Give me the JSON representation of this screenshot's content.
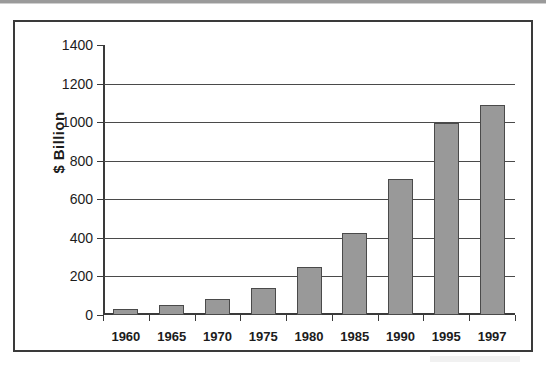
{
  "chart_data": {
    "type": "bar",
    "title": "",
    "subtitle": "",
    "xlabel": "",
    "ylabel": "$ Billion",
    "categories": [
      "1960",
      "1965",
      "1970",
      "1975",
      "1980",
      "1985",
      "1990",
      "1995",
      "1997"
    ],
    "values": [
      30,
      50,
      85,
      140,
      250,
      425,
      705,
      995,
      1090
    ],
    "series": [
      {
        "name": "",
        "values": [
          30,
          50,
          85,
          140,
          250,
          425,
          705,
          995,
          1090
        ]
      }
    ],
    "ylim": [
      0,
      1400
    ],
    "y_ticks": [
      0,
      200,
      400,
      600,
      800,
      1000,
      1200,
      1400
    ],
    "y_tick_labels": [
      "0",
      "200",
      "400",
      "600",
      "800",
      "1000",
      "1200",
      "1400"
    ],
    "grid": "horizontal",
    "legend": "none",
    "annotations": [],
    "colors": {
      "bar_fill": "#999999",
      "bar_outline": "#4a4a4a",
      "axis": "#3a3a3a",
      "gridline": "#4a4a4a",
      "text": "#1c1c1c",
      "background": "#ffffff",
      "frame_border": "#3a3a3a"
    }
  }
}
